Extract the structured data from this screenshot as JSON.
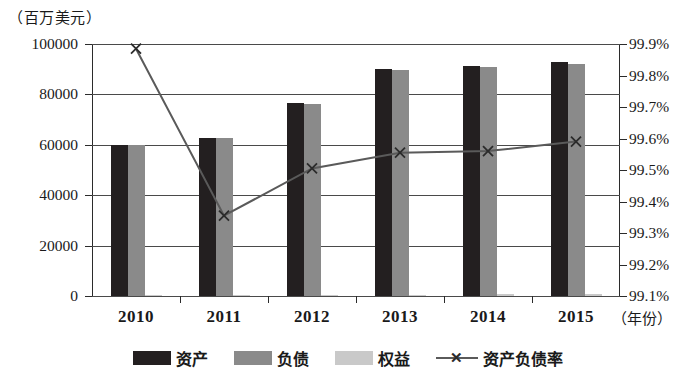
{
  "chart_data": {
    "type": "bar",
    "title": "",
    "unit_label": "（百万美元）",
    "xlabel": "（年份）",
    "categories": [
      "2010",
      "2011",
      "2012",
      "2013",
      "2014",
      "2015"
    ],
    "series": [
      {
        "name": "资产",
        "type": "bar",
        "axis": "left",
        "color": "#231f20",
        "values": [
          60000,
          62800,
          76500,
          90000,
          91200,
          93000
        ]
      },
      {
        "name": "负债",
        "type": "bar",
        "axis": "left",
        "color": "#8a8a8a",
        "values": [
          59800,
          62600,
          76300,
          89800,
          91000,
          92000
        ]
      },
      {
        "name": "权益",
        "type": "bar",
        "axis": "left",
        "color": "#c9c9c9",
        "values": [
          300,
          400,
          500,
          600,
          700,
          900
        ]
      },
      {
        "name": "资产负债率",
        "type": "line",
        "axis": "right",
        "color": "#5a5a5a",
        "marker": "x",
        "values": [
          99.885,
          99.355,
          99.505,
          99.555,
          99.56,
          99.59
        ]
      }
    ],
    "left_axis": {
      "ticks": [
        "0",
        "20000",
        "40000",
        "60000",
        "80000",
        "100000"
      ],
      "min": 0,
      "max": 100000,
      "step": 20000
    },
    "right_axis": {
      "ticks": [
        "99.1%",
        "99.2%",
        "99.3%",
        "99.4%",
        "99.5%",
        "99.6%",
        "99.7%",
        "99.8%",
        "99.9%"
      ],
      "min": 99.1,
      "max": 99.9,
      "step": 0.1
    },
    "grid": true,
    "legend_position": "bottom"
  },
  "legend": {
    "assets": "资产",
    "liabilities": "负债",
    "equity": "权益",
    "ratio": "资产负债率",
    "ratio_marker": "✕"
  }
}
